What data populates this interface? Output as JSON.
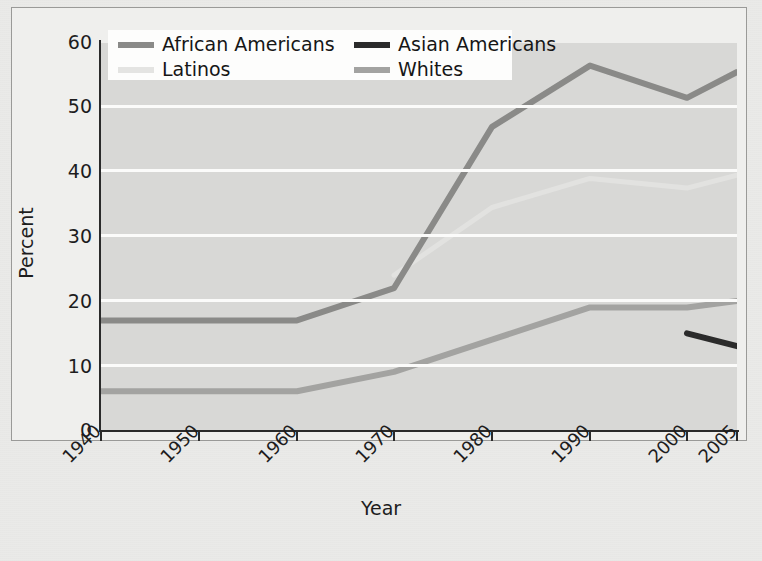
{
  "chart_data": {
    "type": "line",
    "title": "",
    "xlabel": "Year",
    "ylabel": "Percent",
    "x": [
      1940,
      1950,
      1960,
      1970,
      1980,
      1990,
      2000,
      2005
    ],
    "xtick_labels": [
      "1940",
      "1950",
      "1960",
      "1970",
      "1980",
      "1990",
      "2000",
      "2005"
    ],
    "ytick_labels": [
      "0",
      "10",
      "20",
      "30",
      "40",
      "50",
      "60"
    ],
    "yticks": [
      0,
      10,
      20,
      30,
      40,
      50,
      60
    ],
    "ylim": [
      0,
      60
    ],
    "xlim": [
      1940,
      2005
    ],
    "grid": "horizontal",
    "legend_position": "top-left-inside",
    "series": [
      {
        "name": "African Americans",
        "color": "#8a8a88",
        "x": [
          1940,
          1950,
          1960,
          1970,
          1980,
          1990,
          2000,
          2005
        ],
        "values": [
          17,
          17,
          17,
          22,
          47,
          56.5,
          51.5,
          55.5
        ]
      },
      {
        "name": "Asian Americans",
        "color": "#2b2b2b",
        "x": [
          2000,
          2005
        ],
        "values": [
          15,
          13
        ]
      },
      {
        "name": "Latinos",
        "color": "#e2e2e0",
        "x": [
          1970,
          1980,
          1990,
          2000,
          2005
        ],
        "values": [
          24,
          34.5,
          39,
          37.5,
          39.5
        ]
      },
      {
        "name": "Whites",
        "color": "#a3a3a1",
        "x": [
          1940,
          1950,
          1960,
          1970,
          1980,
          1990,
          2000,
          2005
        ],
        "values": [
          6,
          6,
          6,
          9,
          14,
          19,
          19,
          20
        ]
      }
    ]
  },
  "axes": {
    "y_label": "Percent",
    "x_label": "Year",
    "y_ticks": [
      "60",
      "50",
      "40",
      "30",
      "20",
      "10",
      "0"
    ],
    "x_ticks": [
      "1940",
      "1950",
      "1960",
      "1970",
      "1980",
      "1990",
      "2000",
      "2005"
    ]
  },
  "legend": {
    "items": [
      {
        "label": "African Americans",
        "color": "#8a8a88"
      },
      {
        "label": "Asian Americans",
        "color": "#2b2b2b"
      },
      {
        "label": "Latinos",
        "color": "#e4e4e2"
      },
      {
        "label": "Whites",
        "color": "#a3a3a1"
      }
    ]
  }
}
